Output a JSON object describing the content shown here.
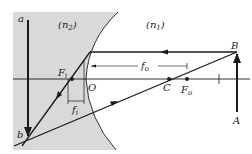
{
  "diagram": {
    "media": {
      "left_label": "(n",
      "left_sub": "2",
      "left_close": ")",
      "right_label": "(n",
      "right_sub": "1",
      "right_close": ")"
    },
    "points": {
      "a": "a",
      "b": "b",
      "A": "A",
      "B": "B",
      "O": "O",
      "C": "C",
      "F_i": "F",
      "F_i_sub": "i",
      "F_o": "F",
      "F_o_sub": "o"
    },
    "dimensions": {
      "f_o": "f",
      "f_o_sub": "o",
      "f_i": "f",
      "f_i_sub": "i"
    },
    "colors": {
      "shade": "#d9d9d9",
      "line": "#1a1a1a"
    }
  }
}
